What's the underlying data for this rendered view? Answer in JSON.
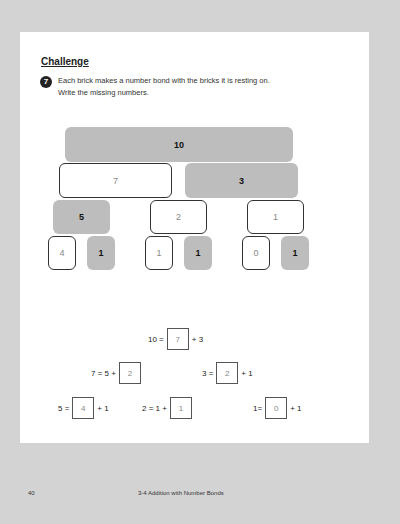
{
  "section": {
    "title": "Challenge"
  },
  "question": {
    "number": "7",
    "lines": [
      "Each brick makes a number bond with the bricks it is resting on.",
      "Write the missing numbers."
    ]
  },
  "bricks": {
    "row1": [
      {
        "value": "10",
        "style": "gray"
      }
    ],
    "row2": [
      {
        "value": "7",
        "style": "white"
      },
      {
        "value": "3",
        "style": "gray"
      }
    ],
    "row3": [
      {
        "value": "5",
        "style": "gray"
      },
      {
        "value": "2",
        "style": "white"
      },
      {
        "value": "1",
        "style": "white"
      }
    ],
    "row4": [
      {
        "value": "4",
        "style": "white"
      },
      {
        "value": "1",
        "style": "gray"
      },
      {
        "value": "1",
        "style": "white"
      },
      {
        "value": "1",
        "style": "gray"
      },
      {
        "value": "0",
        "style": "white"
      },
      {
        "value": "1",
        "style": "gray"
      }
    ]
  },
  "equations": [
    {
      "before": "10 =",
      "answer": "7",
      "after": "+ 3"
    },
    {
      "before": "7 = 5 +",
      "answer": "2",
      "after": ""
    },
    {
      "before": "3 =",
      "answer": "2",
      "after": "+ 1"
    },
    {
      "before": "5 =",
      "answer": "4",
      "after": "+ 1"
    },
    {
      "before": "2 = 1 +",
      "answer": "1",
      "after": ""
    },
    {
      "before": "1=",
      "answer": "0",
      "after": "+ 1"
    }
  ],
  "footer": {
    "page_number": "40",
    "chapter": "3-4  Addition with Number Bonds"
  },
  "colors": {
    "gray_brick": "#bdbdbd",
    "background": "#d3d3d3"
  }
}
